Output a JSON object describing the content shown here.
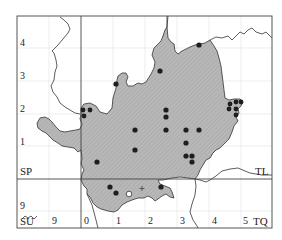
{
  "map": {
    "type": "distribution grid map",
    "colors": {
      "frame": "#555555",
      "grid_major": "#444444",
      "grid_minor": "#dddddd",
      "region_fill": "#b5b5b5",
      "region_stroke": "#333333",
      "river": "#333333",
      "dot": "#1e1e1e"
    },
    "grid_squares": {
      "top_left": "SP",
      "top_right": "TL",
      "bottom_left": "SU",
      "bottom_right": "TQ"
    },
    "left_axis_labels": [
      "4",
      "3",
      "2",
      "1",
      "9"
    ],
    "bottom_axis_labels": [
      "9",
      "0",
      "1",
      "2",
      "3",
      "4",
      "5"
    ],
    "symbols": {
      "filled_dots": 32,
      "open_circles": 1,
      "plus_markers": 1
    }
  }
}
